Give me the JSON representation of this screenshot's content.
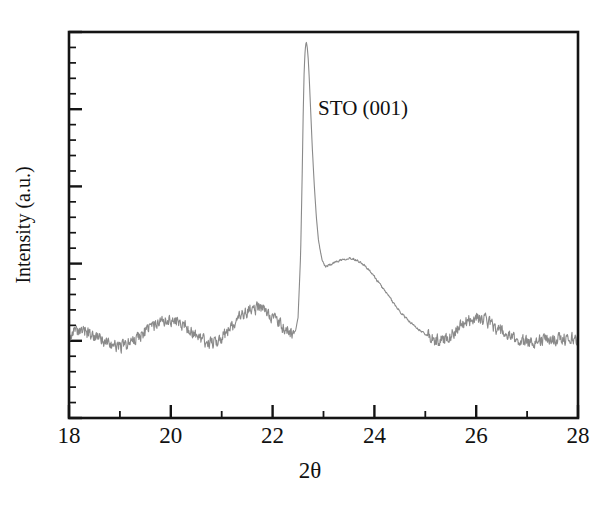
{
  "figure": {
    "background_color": "#ffffff",
    "frame_color": "#141414",
    "trace_color": "#8a8a8a"
  },
  "annotations": [
    {
      "name": "sto-peak-label",
      "text": "STO (001)",
      "x": 23.0,
      "y_frac": 0.8
    }
  ],
  "axes": {
    "x": {
      "label": "2θ",
      "min": 18,
      "max": 28,
      "major_ticks": [
        18,
        20,
        22,
        24,
        26,
        28
      ],
      "major_tick_labels": [
        "18",
        "20",
        "22",
        "24",
        "26",
        "28"
      ],
      "minor_ticks": [
        19,
        21,
        23,
        25,
        27
      ]
    },
    "y": {
      "label": "Intensity (a.u.)",
      "min": 0,
      "max": 1,
      "major_tick_count": 6,
      "minor_per_major": 5,
      "tick_labels": []
    }
  },
  "chart_data": {
    "type": "line",
    "title": "",
    "xlabel": "2θ",
    "ylabel": "Intensity (a.u.)",
    "xlim": [
      18,
      28
    ],
    "ylim": [
      0,
      1
    ],
    "grid": false,
    "legend": null,
    "annotations": [
      "STO (001)"
    ],
    "series": [
      {
        "name": "XRD pattern",
        "color": "#8a8a8a",
        "noise_amplitude": 0.022,
        "x": [
          18.0,
          18.1,
          18.2,
          18.3,
          18.4,
          18.5,
          18.6,
          18.7,
          18.8,
          18.9,
          19.0,
          19.1,
          19.2,
          19.3,
          19.4,
          19.5,
          19.6,
          19.7,
          19.8,
          19.9,
          20.0,
          20.1,
          20.2,
          20.3,
          20.4,
          20.5,
          20.6,
          20.7,
          20.8,
          20.9,
          21.0,
          21.1,
          21.2,
          21.3,
          21.4,
          21.5,
          21.6,
          21.7,
          21.8,
          21.9,
          22.0,
          22.1,
          22.2,
          22.3,
          22.4,
          22.45,
          22.5,
          22.55,
          22.58,
          22.6,
          22.62,
          22.64,
          22.66,
          22.68,
          22.7,
          22.72,
          22.75,
          22.78,
          22.82,
          22.86,
          22.9,
          22.95,
          23.0,
          23.05,
          23.1,
          23.2,
          23.3,
          23.4,
          23.5,
          23.6,
          23.7,
          23.8,
          23.9,
          24.0,
          24.1,
          24.2,
          24.3,
          24.4,
          24.5,
          24.6,
          24.7,
          24.8,
          24.9,
          25.0,
          25.05,
          25.1,
          25.2,
          25.3,
          25.4,
          25.5,
          25.6,
          25.7,
          25.8,
          25.9,
          26.0,
          26.1,
          26.2,
          26.3,
          26.4,
          26.5,
          26.6,
          26.7,
          26.8,
          26.9,
          27.0,
          27.2,
          27.4,
          27.6,
          27.8,
          28.0
        ],
        "y": [
          0.215,
          0.222,
          0.218,
          0.226,
          0.219,
          0.212,
          0.205,
          0.198,
          0.192,
          0.188,
          0.185,
          0.188,
          0.195,
          0.204,
          0.214,
          0.224,
          0.234,
          0.242,
          0.248,
          0.252,
          0.254,
          0.251,
          0.245,
          0.236,
          0.226,
          0.214,
          0.203,
          0.196,
          0.194,
          0.198,
          0.208,
          0.222,
          0.238,
          0.252,
          0.264,
          0.274,
          0.281,
          0.284,
          0.282,
          0.274,
          0.262,
          0.248,
          0.234,
          0.224,
          0.22,
          0.225,
          0.26,
          0.42,
          0.62,
          0.78,
          0.9,
          0.955,
          0.975,
          0.962,
          0.93,
          0.88,
          0.79,
          0.7,
          0.6,
          0.52,
          0.462,
          0.42,
          0.4,
          0.392,
          0.396,
          0.402,
          0.408,
          0.412,
          0.414,
          0.412,
          0.406,
          0.396,
          0.382,
          0.366,
          0.348,
          0.33,
          0.312,
          0.294,
          0.276,
          0.262,
          0.248,
          0.236,
          0.226,
          0.218,
          0.212,
          0.205,
          0.2,
          0.202,
          0.208,
          0.216,
          0.226,
          0.238,
          0.248,
          0.256,
          0.26,
          0.258,
          0.252,
          0.243,
          0.233,
          0.223,
          0.214,
          0.207,
          0.202,
          0.199,
          0.198,
          0.2,
          0.203,
          0.205,
          0.206,
          0.207
        ]
      }
    ]
  }
}
